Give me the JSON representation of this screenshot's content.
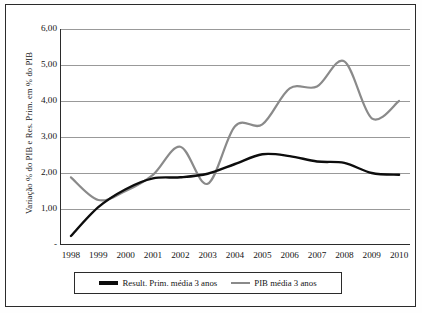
{
  "chart_data": {
    "type": "line",
    "title": "",
    "xlabel": "",
    "ylabel": "Variação % do PIB e Res. Prim. em % do PIB",
    "xlim": [
      1997.6,
      2010.4
    ],
    "ylim": [
      0,
      6
    ],
    "grid": true,
    "legend_position": "bottom",
    "categories": [
      1998,
      1999,
      2000,
      2001,
      2002,
      2003,
      2004,
      2005,
      2006,
      2007,
      2008,
      2009,
      2010
    ],
    "x_tick_labels": [
      "1998",
      "1999",
      "2000",
      "2001",
      "2002",
      "2003",
      "2004",
      "2005",
      "2006",
      "2007",
      "2008",
      "2009",
      "2010"
    ],
    "y_tick_labels": [
      "6,00",
      "5,00",
      "4,00",
      "3,00",
      "2,00",
      "1,00",
      "-"
    ],
    "y_tick_values": [
      6,
      5,
      4,
      3,
      2,
      1,
      0
    ],
    "series": [
      {
        "name": "Result. Prim. média 3 anos",
        "color": "#0d0d0d",
        "values": [
          0.25,
          1.05,
          1.55,
          1.85,
          1.88,
          1.98,
          2.25,
          2.52,
          2.47,
          2.32,
          2.28,
          2.0,
          1.95
        ]
      },
      {
        "name": "PIB média 3 anos",
        "color": "#8a8a8a",
        "values": [
          1.88,
          1.25,
          1.5,
          1.95,
          2.73,
          1.7,
          3.3,
          3.35,
          4.35,
          4.4,
          5.1,
          3.52,
          4.0
        ]
      }
    ]
  },
  "legend": {
    "entries": [
      {
        "label": "Result. Prim. média 3 anos"
      },
      {
        "label": "PIB média 3 anos"
      }
    ]
  }
}
